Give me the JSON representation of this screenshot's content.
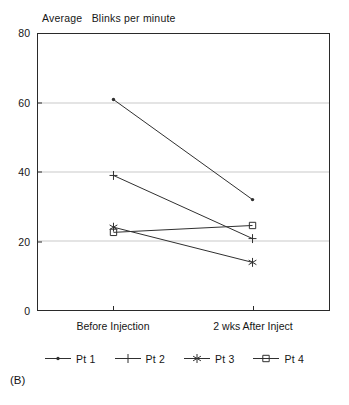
{
  "panel": {
    "tag": "(B)"
  },
  "chart_data": {
    "type": "line",
    "title": "Average   Blinks per minute",
    "xlabel": "",
    "ylabel": "",
    "categories": [
      "Before Injection",
      "2 wks After Inject"
    ],
    "ylim": [
      0,
      80
    ],
    "yticks": [
      0,
      20,
      40,
      60,
      80
    ],
    "ytick_labels": [
      "0",
      "20",
      "40",
      "60",
      "80"
    ],
    "grid": "horizontal gridlines at 20, 40, 60 (light gray); solid plot frame box",
    "legend_position": "below axes, centered, horizontal",
    "series": [
      {
        "name": "Pt 1",
        "marker": "dot",
        "values": [
          61,
          32
        ]
      },
      {
        "name": "Pt 2",
        "marker": "plus",
        "values": [
          39,
          20.7
        ]
      },
      {
        "name": "Pt 3",
        "marker": "asterisk",
        "values": [
          24,
          13.8
        ]
      },
      {
        "name": "Pt 4",
        "marker": "square",
        "values": [
          22.5,
          24.5
        ]
      }
    ],
    "colors": {
      "line": "#303030",
      "frame": "#2a2a2a",
      "grid": "#c9c9c9",
      "text": "#161616",
      "background": "#ffffff"
    }
  }
}
